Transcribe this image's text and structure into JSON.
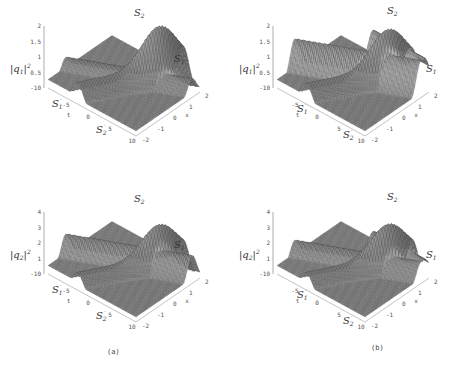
{
  "figure": {
    "captions": [
      "(a)",
      "(b)"
    ]
  },
  "chart_data": [
    {
      "type": "surface3d",
      "panel": "a-top",
      "zlabel": "|q1|^2",
      "zlabel_main": "|q",
      "zlabel_sub": "1",
      "zlabel_tail": "|",
      "zlabel_sup": "2",
      "xlabel": "t",
      "ylabel": "x",
      "t_ticks": [
        "-10",
        "-5",
        "0",
        "5",
        "10"
      ],
      "x_ticks": [
        "-2",
        "-1",
        "0",
        "1",
        "2"
      ],
      "z_ticks": [
        "0.5",
        "1",
        "1.5",
        "2"
      ],
      "zlim": [
        0,
        2
      ],
      "annotations": [
        {
          "text": "S",
          "sub": "2",
          "where": "peak-top"
        },
        {
          "text": "S",
          "sub": "1",
          "where": "right"
        },
        {
          "text": "S",
          "sub": "1",
          "sup": "-",
          "where": "left-front"
        },
        {
          "text": "S",
          "sub": "2",
          "sup": "-",
          "where": "bottom-front"
        }
      ],
      "features": {
        "s2_peak": 2.0,
        "s1_ridge": 0.6,
        "background": 0.5
      }
    },
    {
      "type": "surface3d",
      "panel": "b-top",
      "zlabel": "|q1|^2",
      "zlabel_main": "|q",
      "zlabel_sub": "1",
      "zlabel_tail": "|",
      "zlabel_sup": "2",
      "xlabel": "t",
      "ylabel": "x",
      "t_ticks": [
        "-10",
        "-5",
        "0",
        "5",
        "10"
      ],
      "x_ticks": [
        "-2",
        "-1",
        "0",
        "1",
        "2"
      ],
      "z_ticks": [
        "0.5",
        "1",
        "1.5",
        "2"
      ],
      "zlim": [
        0,
        2
      ],
      "annotations": [
        {
          "text": "S",
          "sub": "2",
          "where": "peak-top"
        },
        {
          "text": "S",
          "sub": "1",
          "where": "right"
        },
        {
          "text": "S",
          "sub": "1",
          "sup": "-",
          "where": "left-front"
        },
        {
          "text": "S",
          "sub": "2",
          "sup": "-",
          "where": "bottom-front"
        }
      ],
      "features": {
        "s2_peak": 2.0,
        "s1_ridge": 1.2,
        "background": 0.5
      }
    },
    {
      "type": "surface3d",
      "panel": "a-bottom",
      "zlabel": "|q2|^2",
      "zlabel_main": "|q",
      "zlabel_sub": "2",
      "zlabel_tail": "|",
      "zlabel_sup": "2",
      "xlabel": "t",
      "ylabel": "x",
      "t_ticks": [
        "-10",
        "-5",
        "0",
        "5",
        "10"
      ],
      "x_ticks": [
        "-2",
        "-1",
        "0",
        "1",
        "2"
      ],
      "z_ticks": [
        "1",
        "2",
        "3",
        "4"
      ],
      "zlim": [
        0,
        4
      ],
      "annotations": [
        {
          "text": "S",
          "sub": "2",
          "where": "peak-top"
        },
        {
          "text": "S",
          "sub": "1",
          "where": "right"
        },
        {
          "text": "S",
          "sub": "1",
          "sup": "-",
          "where": "left-front"
        },
        {
          "text": "S",
          "sub": "2",
          "sup": "-",
          "where": "bottom-front"
        }
      ],
      "features": {
        "s2_peak": 3.2,
        "s1_ridge": 1.8,
        "background": 1.0
      }
    },
    {
      "type": "surface3d",
      "panel": "b-bottom",
      "zlabel": "|q2|^2",
      "zlabel_main": "|q",
      "zlabel_sub": "2",
      "zlabel_tail": "|",
      "zlabel_sup": "2",
      "xlabel": "t",
      "ylabel": "x",
      "t_ticks": [
        "-10",
        "-5",
        "0",
        "5",
        "10"
      ],
      "x_ticks": [
        "-2",
        "-1",
        "0",
        "1",
        "2"
      ],
      "z_ticks": [
        "1",
        "2",
        "3",
        "4"
      ],
      "zlim": [
        0,
        4
      ],
      "annotations": [
        {
          "text": "S",
          "sub": "2",
          "where": "peak-top"
        },
        {
          "text": "S",
          "sub": "1",
          "where": "right"
        },
        {
          "text": "S",
          "sub": "1",
          "sup": "-",
          "where": "left-front"
        },
        {
          "text": "S",
          "sub": "2",
          "sup": "-",
          "where": "bottom-front"
        }
      ],
      "features": {
        "s2_peak": 3.4,
        "s1_ridge": 1.4,
        "background": 1.0
      }
    }
  ]
}
